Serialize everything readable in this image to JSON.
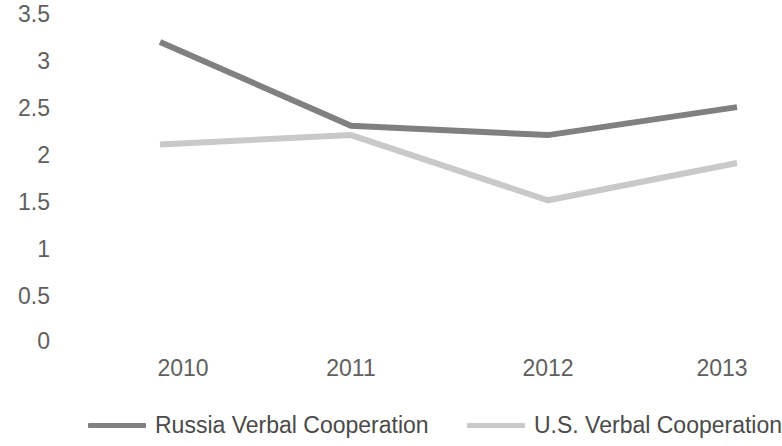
{
  "chart_data": {
    "type": "line",
    "title": "",
    "subtitle": "",
    "xlabel": "",
    "ylabel": "",
    "categories": [
      "2010",
      "2011",
      "2012",
      "2013"
    ],
    "x": [
      2010,
      2011,
      2012,
      2013
    ],
    "ylim": [
      0,
      3.5
    ],
    "y_ticks": [
      "0",
      "0.5",
      "1",
      "1.5",
      "2",
      "2.5",
      "3",
      "3.5"
    ],
    "y_tick_values": [
      0,
      0.5,
      1,
      1.5,
      2,
      2.5,
      3,
      3.5
    ],
    "x_ticks": [
      "2010",
      "2011",
      "2012",
      "2013"
    ],
    "grid": false,
    "legend_position": "bottom",
    "series": [
      {
        "name": "Russia Verbal Cooperation",
        "values": [
          3.2,
          2.3,
          2.2,
          2.5
        ],
        "color": "#808080"
      },
      {
        "name": "U.S. Verbal Cooperation",
        "values": [
          2.1,
          2.2,
          1.5,
          1.9
        ],
        "color": "#c9c9c9"
      }
    ]
  },
  "axis": {
    "tick_label_color": "#5f5f5f"
  },
  "legend": {
    "entries": [
      {
        "label": "Russia Verbal Cooperation",
        "color": "#808080"
      },
      {
        "label": "U.S. Verbal Cooperation",
        "color": "#c9c9c9"
      }
    ]
  }
}
